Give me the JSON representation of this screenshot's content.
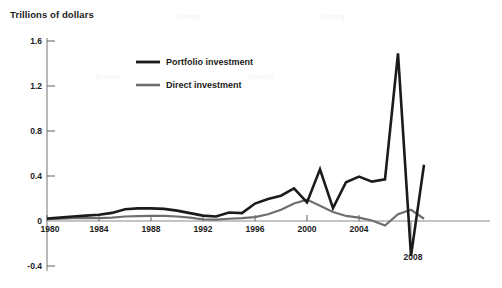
{
  "chart_data": {
    "type": "line",
    "title": "Trillions of dollars",
    "xlabel": "",
    "ylabel": "Trillions of dollars",
    "xlim": [
      1980,
      2009
    ],
    "ylim": [
      -0.4,
      1.6
    ],
    "grid": false,
    "zero_line": true,
    "legend_position": "inside-upper-left",
    "y_ticks": [
      "1.6",
      "1.2",
      "0.8",
      "0.4",
      "0"
    ],
    "y_tick_values": [
      1.6,
      1.2,
      0.8,
      0.4,
      0
    ],
    "y_tick_negative": "-0.4",
    "y_tick_negative_value": -0.4,
    "x_ticks": [
      "1980",
      "1984",
      "1988",
      "1992",
      "1996",
      "2000",
      "2004",
      "2008"
    ],
    "x_tick_values": [
      1980,
      1984,
      1988,
      1992,
      1996,
      2000,
      2004,
      2008
    ],
    "x": [
      1980,
      1981,
      1982,
      1983,
      1984,
      1985,
      1986,
      1987,
      1988,
      1989,
      1990,
      1991,
      1992,
      1993,
      1994,
      1995,
      1996,
      1997,
      1998,
      1999,
      2000,
      2001,
      2002,
      2003,
      2004,
      2005,
      2006,
      2007,
      2008,
      2009
    ],
    "series": [
      {
        "name": "Portfolio investment",
        "color": "#1b1b1b",
        "width": 2.6,
        "values": [
          0.022,
          0.03,
          0.04,
          0.05,
          0.055,
          0.07,
          0.1,
          0.115,
          0.115,
          0.112,
          0.1,
          0.08,
          0.055,
          0.045,
          0.06,
          0.055,
          0.09,
          0.12,
          0.155,
          0.19,
          0.235,
          0.28,
          0.345,
          0.31,
          0.475,
          0.115,
          0.27,
          0.345,
          0.32,
          0.44
        ]
      },
      {
        "name": "Direct investment",
        "color": "#6e6e6e",
        "width": 2.2,
        "values": [
          0.016,
          0.02,
          0.025,
          0.025,
          0.026,
          0.03,
          0.04,
          0.043,
          0.045,
          0.045,
          0.04,
          0.03,
          0.015,
          0.013,
          0.02,
          0.025,
          0.035,
          0.06,
          0.1,
          0.155,
          0.19,
          0.135,
          0.08,
          0.045,
          0.03,
          0.005,
          -0.04,
          0.06,
          0.1,
          0.02
        ]
      }
    ],
    "series_actual": [
      {
        "name": "Portfolio investment",
        "points": [
          {
            "year": 1980,
            "value": 0.022
          },
          {
            "year": 1981,
            "value": 0.03
          },
          {
            "year": 1982,
            "value": 0.04
          },
          {
            "year": 1983,
            "value": 0.048
          },
          {
            "year": 1984,
            "value": 0.055
          },
          {
            "year": 1985,
            "value": 0.072
          },
          {
            "year": 1986,
            "value": 0.105
          },
          {
            "year": 1987,
            "value": 0.112
          },
          {
            "year": 1988,
            "value": 0.112
          },
          {
            "year": 1989,
            "value": 0.108
          },
          {
            "year": 1990,
            "value": 0.092
          },
          {
            "year": 1991,
            "value": 0.07
          },
          {
            "year": 1992,
            "value": 0.048
          },
          {
            "year": 1993,
            "value": 0.04
          },
          {
            "year": 1994,
            "value": 0.075
          },
          {
            "year": 1995,
            "value": 0.07
          },
          {
            "year": 1996,
            "value": 0.155
          },
          {
            "year": 1997,
            "value": 0.195
          },
          {
            "year": 1998,
            "value": 0.225
          },
          {
            "year": 1999,
            "value": 0.29
          },
          {
            "year": 2000,
            "value": 0.165
          },
          {
            "year": 2001,
            "value": 0.46
          },
          {
            "year": 2002,
            "value": 0.115
          },
          {
            "year": 2003,
            "value": 0.345
          },
          {
            "year": 2004,
            "value": 0.395
          },
          {
            "year": 2005,
            "value": 0.35
          },
          {
            "year": 2006,
            "value": 0.37
          },
          {
            "year": 2007,
            "value": 1.49
          },
          {
            "year": 2008,
            "value": -0.31
          },
          {
            "year": 2009,
            "value": 0.5
          }
        ]
      }
    ],
    "annotations": []
  },
  "legend": {
    "items": [
      {
        "label": "Portfolio investment",
        "color": "#1b1b1b"
      },
      {
        "label": "Direct investment",
        "color": "#6e6e6e"
      }
    ]
  },
  "axis_labels": {
    "y": [
      "1.6",
      "1.2",
      "0.8",
      "0.4",
      "0",
      "-0.4"
    ],
    "x": [
      "1980",
      "1984",
      "1988",
      "1992",
      "1996",
      "2000",
      "2004",
      "2008"
    ]
  },
  "watermarks": [
    "alamy",
    "alamy",
    "alamy",
    "alamy"
  ]
}
